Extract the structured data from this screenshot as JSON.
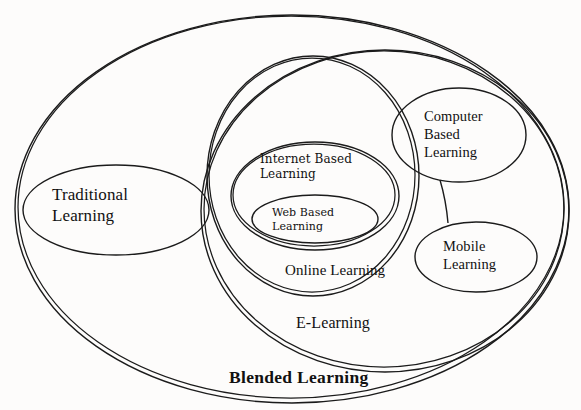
{
  "diagram": {
    "title": "Blended Learning",
    "type": "nested-venn-ellipses",
    "background_color": "#fdfcfb",
    "stroke_color": "#1b1b1b",
    "sets": [
      {
        "id": "blended-learning",
        "label": "Blended Learning",
        "label_position": "bottom-inside",
        "level": 0,
        "bold": true
      },
      {
        "id": "traditional-learning",
        "label": "Traditional\nLearning",
        "label_position": "center",
        "level": 1,
        "parent": "blended-learning"
      },
      {
        "id": "e-learning",
        "label": "E-Learning",
        "label_position": "bottom-inside",
        "level": 1,
        "parent": "blended-learning"
      },
      {
        "id": "online-learning",
        "label": "Online Learning",
        "label_position": "bottom-inside",
        "level": 2,
        "parent": "e-learning"
      },
      {
        "id": "computer-based-learning",
        "label": "Computer\nBased\nLearning",
        "label_position": "center",
        "level": 2,
        "parent": "e-learning"
      },
      {
        "id": "mobile-learning",
        "label": "Mobile\nLearning",
        "label_position": "center",
        "level": 2,
        "parent": "e-learning"
      },
      {
        "id": "internet-based-learning",
        "label": "Internet Based\nLearning",
        "label_position": "top-inside",
        "level": 3,
        "parent": "online-learning"
      },
      {
        "id": "web-based-learning",
        "label": "Web Based\nLearning",
        "label_position": "center",
        "level": 4,
        "parent": "internet-based-learning"
      }
    ],
    "connector": {
      "from": "computer-based-learning",
      "to": "mobile-learning"
    }
  }
}
